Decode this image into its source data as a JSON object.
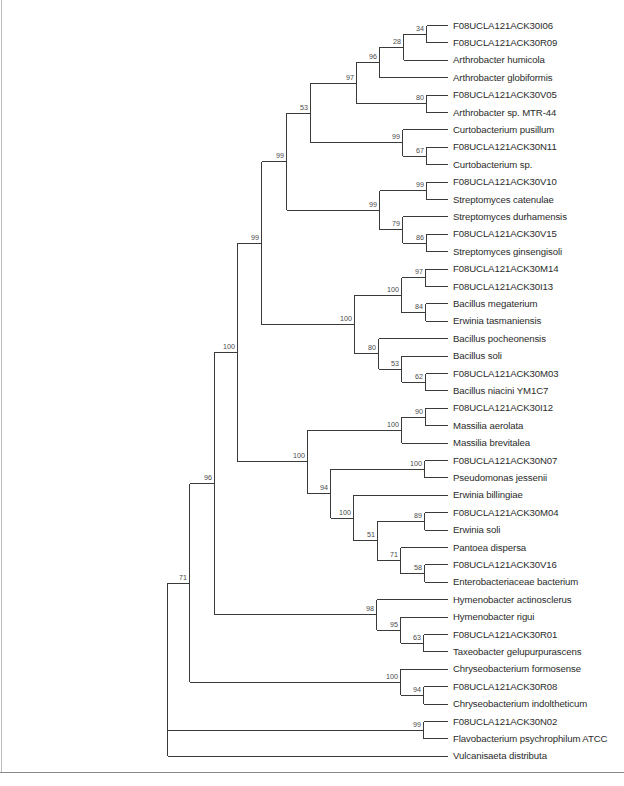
{
  "figure": {
    "type": "phylogenetic-tree",
    "layout": "rectangular",
    "leaf_x": 447,
    "label_x": 453,
    "leaf_y_start": 25,
    "leaf_spacing": 17.4,
    "colors": {
      "branch": "#3a3a3a",
      "label": "#2b2b2b",
      "support": "#4a4a4a"
    }
  },
  "leaves": [
    "F08UCLA121ACK30I06",
    "F08UCLA121ACK30R09",
    "Arthrobacter humicola",
    "Arthrobacter globiformis",
    "F08UCLA121ACK30V05",
    "Arthrobacter sp. MTR-44",
    "Curtobacterium pusillum",
    "F08UCLA121ACK30N11",
    "Curtobacterium sp.",
    "F08UCLA121ACK30V10",
    "Streptomyces catenulae",
    "Streptomyces durhamensis",
    "F08UCLA121ACK30V15",
    "Streptomyces ginsengisoli",
    "F08UCLA121ACK30M14",
    "F08UCLA121ACK30I13",
    "Bacillus megaterium",
    "Erwinia tasmaniensis",
    "Bacillus pocheonensis",
    "Bacillus soli",
    "F08UCLA121ACK30M03",
    "Bacillus niacini YM1C7",
    "F08UCLA121ACK30I12",
    "Massilia aerolata",
    "Massilia brevitalea",
    "F08UCLA121ACK30N07",
    "Pseudomonas jessenii",
    "Erwinia billingiae",
    "F08UCLA121ACK30M04",
    "Erwinia soli",
    "Pantoea dispersa",
    "F08UCLA121ACK30V16",
    "Enterobacteriaceae bacterium",
    "Hymenobacter actinosclerus",
    "Hymenobacter rigui",
    "F08UCLA121ACK30R01",
    "Taxeobacter gelupurpurascens",
    "Chryseobacterium formosense",
    "F08UCLA121ACK30R08",
    "Chryseobacterium indoltheticum",
    "F08UCLA121ACK30N02",
    "Flavobacterium psychrophilum ATCC",
    "Vulcanisaeta distributa"
  ],
  "tree": {
    "x": 167,
    "support": null,
    "children": [
      {
        "x": 189,
        "support": "71",
        "children": [
          {
            "x": 214,
            "support": "96",
            "children": [
              {
                "x": 237,
                "support": "100",
                "children": [
                  {
                    "x": 261,
                    "support": "99",
                    "children": [
                      {
                        "x": 286,
                        "support": "99",
                        "children": [
                          {
                            "x": 310,
                            "support": "53",
                            "children": [
                              {
                                "x": 356,
                                "support": "97",
                                "children": [
                                  {
                                    "x": 379,
                                    "support": "96",
                                    "children": [
                                      {
                                        "x": 403,
                                        "support": "28",
                                        "children": [
                                          {
                                            "x": 426,
                                            "support": "34",
                                            "children": [
                                              {
                                                "leaf": 0
                                              },
                                              {
                                                "leaf": 1
                                              }
                                            ]
                                          },
                                          {
                                            "leaf": 2
                                          }
                                        ]
                                      },
                                      {
                                        "leaf": 3
                                      }
                                    ]
                                  },
                                  {
                                    "x": 426,
                                    "support": "80",
                                    "children": [
                                      {
                                        "leaf": 4
                                      },
                                      {
                                        "leaf": 5
                                      }
                                    ]
                                  }
                                ]
                              },
                              {
                                "x": 402,
                                "support": "99",
                                "children": [
                                  {
                                    "leaf": 6
                                  },
                                  {
                                    "x": 426,
                                    "support": "67",
                                    "children": [
                                      {
                                        "leaf": 7
                                      },
                                      {
                                        "leaf": 8
                                      }
                                    ]
                                  }
                                ]
                              }
                            ]
                          },
                          {
                            "x": 379,
                            "support": "99",
                            "children": [
                              {
                                "x": 426,
                                "support": "99",
                                "children": [
                                  {
                                    "leaf": 9
                                  },
                                  {
                                    "leaf": 10
                                  }
                                ]
                              },
                              {
                                "x": 402,
                                "support": "79",
                                "children": [
                                  {
                                    "leaf": 11
                                  },
                                  {
                                    "x": 426,
                                    "support": "86",
                                    "children": [
                                      {
                                        "leaf": 12
                                      },
                                      {
                                        "leaf": 13
                                      }
                                    ]
                                  }
                                ]
                              }
                            ]
                          }
                        ]
                      },
                      {
                        "x": 354,
                        "support": "100",
                        "children": [
                          {
                            "x": 401,
                            "support": "100",
                            "children": [
                              {
                                "x": 425,
                                "support": "97",
                                "children": [
                                  {
                                    "leaf": 14
                                  },
                                  {
                                    "leaf": 15
                                  }
                                ]
                              },
                              {
                                "x": 425,
                                "support": "84",
                                "children": [
                                  {
                                    "leaf": 16
                                  },
                                  {
                                    "leaf": 17
                                  }
                                ]
                              }
                            ]
                          },
                          {
                            "x": 378,
                            "support": "80",
                            "children": [
                              {
                                "leaf": 18
                              },
                              {
                                "x": 401,
                                "support": "53",
                                "children": [
                                  {
                                    "leaf": 19
                                  },
                                  {
                                    "x": 425,
                                    "support": "62",
                                    "children": [
                                      {
                                        "leaf": 20
                                      },
                                      {
                                        "leaf": 21
                                      }
                                    ]
                                  }
                                ]
                              }
                            ]
                          }
                        ]
                      }
                    ]
                  },
                  {
                    "x": 307,
                    "support": "100",
                    "children": [
                      {
                        "x": 401,
                        "support": "100",
                        "children": [
                          {
                            "x": 425,
                            "support": "90",
                            "children": [
                              {
                                "leaf": 22
                              },
                              {
                                "leaf": 23
                              }
                            ]
                          },
                          {
                            "leaf": 24
                          }
                        ]
                      },
                      {
                        "x": 330,
                        "support": "94",
                        "children": [
                          {
                            "x": 424,
                            "support": "100",
                            "children": [
                              {
                                "leaf": 25
                              },
                              {
                                "leaf": 26
                              }
                            ]
                          },
                          {
                            "x": 353,
                            "support": "100",
                            "children": [
                              {
                                "leaf": 27
                              },
                              {
                                "x": 377,
                                "support": "51",
                                "children": [
                                  {
                                    "x": 424,
                                    "support": "89",
                                    "children": [
                                      {
                                        "leaf": 28
                                      },
                                      {
                                        "leaf": 29
                                      }
                                    ]
                                  },
                                  {
                                    "x": 400,
                                    "support": "71",
                                    "children": [
                                      {
                                        "leaf": 30
                                      },
                                      {
                                        "x": 424,
                                        "support": "58",
                                        "children": [
                                          {
                                            "leaf": 31
                                          },
                                          {
                                            "leaf": 32
                                          }
                                        ]
                                      }
                                    ]
                                  }
                                ]
                              }
                            ]
                          }
                        ]
                      }
                    ]
                  }
                ]
              },
              {
                "x": 376,
                "support": "98",
                "children": [
                  {
                    "leaf": 33
                  },
                  {
                    "x": 400,
                    "support": "95",
                    "children": [
                      {
                        "leaf": 34
                      },
                      {
                        "x": 423,
                        "support": "63",
                        "children": [
                          {
                            "leaf": 35
                          },
                          {
                            "leaf": 36
                          }
                        ]
                      }
                    ]
                  }
                ]
              }
            ]
          },
          {
            "x": 400,
            "support": "100",
            "children": [
              {
                "leaf": 37
              },
              {
                "x": 423,
                "support": "94",
                "children": [
                  {
                    "leaf": 38
                  },
                  {
                    "leaf": 39
                  }
                ]
              }
            ]
          }
        ]
      },
      {
        "x": 423,
        "support": "99",
        "children": [
          {
            "leaf": 40
          },
          {
            "leaf": 41
          }
        ]
      },
      {
        "leaf": 42
      }
    ]
  }
}
